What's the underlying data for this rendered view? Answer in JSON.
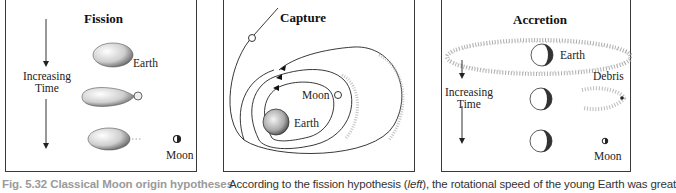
{
  "figure": {
    "panels": [
      {
        "id": "fission",
        "title": "Fission",
        "labels": {
          "earth": "Earth",
          "moon": "Moon",
          "time_line1": "Increasing",
          "time_line2": "Time"
        }
      },
      {
        "id": "capture",
        "title": "Capture",
        "labels": {
          "moon": "Moon",
          "earth": "Earth"
        }
      },
      {
        "id": "accretion",
        "title": "Accretion",
        "labels": {
          "earth": "Earth",
          "debris": "Debris",
          "moon": "Moon",
          "time_line1": "Increasing",
          "time_line2": "Time"
        }
      }
    ],
    "caption": {
      "fig_label": "Fig. 5.32 Classical Moon origin hypotheses",
      "body_prefix": "According to the fission hypothesis (",
      "body_italic": "left",
      "body_suffix": "), the rotational speed of the young Earth was great"
    }
  }
}
